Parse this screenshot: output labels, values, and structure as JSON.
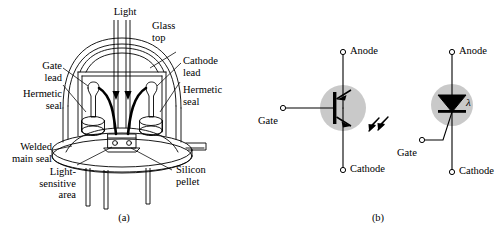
{
  "figure": {
    "background": "#ffffff",
    "ink": "#000000",
    "shade": "#c9c9c9"
  },
  "panel_a": {
    "caption": "(a)",
    "labels": {
      "light": "Light",
      "glass_top": "Glass\ntop",
      "gate_lead": "Gate\nlead",
      "cathode_lead": "Cathode\nlead",
      "hermetic_seal_left": "Hermetic\nseal",
      "hermetic_seal_right": "Hermetic\nseal",
      "welded_main_seal": "Welded\nmain seal",
      "light_sensitive_area": "Light-\nsensitive\narea",
      "silicon_pellet": "Silicon\npellet"
    }
  },
  "panel_b": {
    "caption": "(b)",
    "symbol_left": {
      "name": "lascr-transistor-symbol",
      "anode": "Anode",
      "cathode": "Cathode",
      "gate": "Gate"
    },
    "symbol_right": {
      "name": "lascr-thyristor-symbol",
      "anode": "Anode",
      "cathode": "Cathode",
      "gate": "Gate",
      "wavelength": "λ"
    }
  }
}
